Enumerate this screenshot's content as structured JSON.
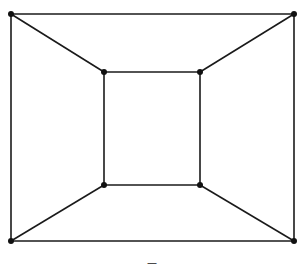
{
  "diagram": {
    "type": "graph",
    "caption": "—",
    "line_color": "#1a1a1a",
    "node_color": "#111111",
    "nodes": [
      {
        "id": "outer-tl",
        "x": 11,
        "y": 14
      },
      {
        "id": "outer-tr",
        "x": 294,
        "y": 14
      },
      {
        "id": "outer-br",
        "x": 294,
        "y": 241
      },
      {
        "id": "outer-bl",
        "x": 11,
        "y": 241
      },
      {
        "id": "inner-tl",
        "x": 104,
        "y": 72
      },
      {
        "id": "inner-tr",
        "x": 200,
        "y": 72
      },
      {
        "id": "inner-br",
        "x": 200,
        "y": 185
      },
      {
        "id": "inner-bl",
        "x": 104,
        "y": 185
      }
    ],
    "edges": [
      [
        "outer-tl",
        "outer-tr"
      ],
      [
        "outer-tr",
        "outer-br"
      ],
      [
        "outer-br",
        "outer-bl"
      ],
      [
        "outer-bl",
        "outer-tl"
      ],
      [
        "inner-tl",
        "inner-tr"
      ],
      [
        "inner-tr",
        "inner-br"
      ],
      [
        "inner-br",
        "inner-bl"
      ],
      [
        "inner-bl",
        "inner-tl"
      ],
      [
        "outer-tl",
        "inner-tl"
      ],
      [
        "outer-tr",
        "inner-tr"
      ],
      [
        "outer-br",
        "inner-br"
      ],
      [
        "outer-bl",
        "inner-bl"
      ]
    ]
  }
}
